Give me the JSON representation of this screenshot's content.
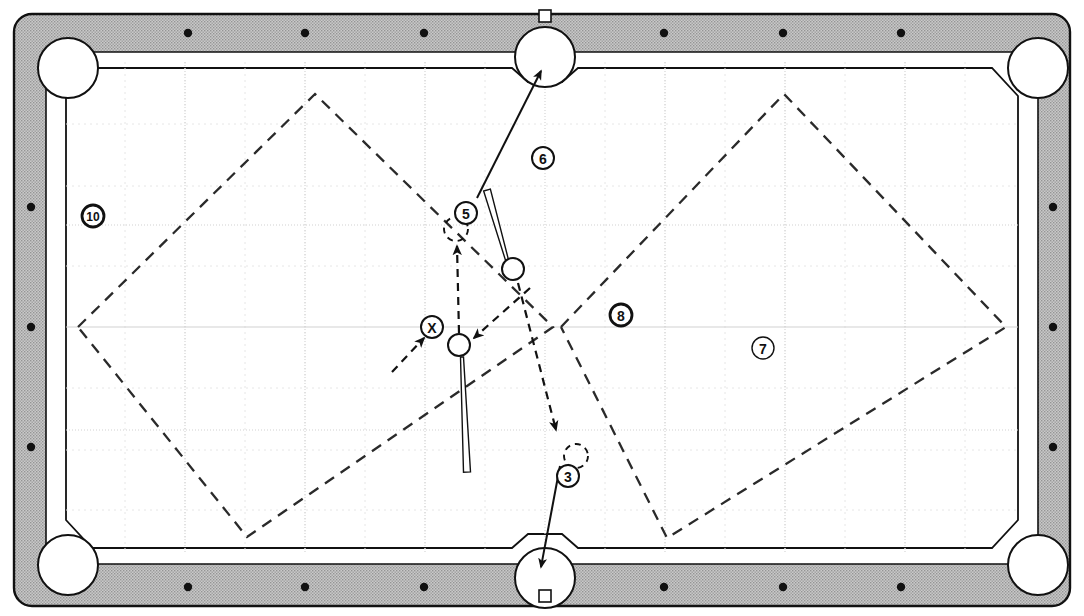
{
  "diagram": {
    "surface_color": "#ffffff",
    "rail_color": "#b3b3b3",
    "rail_edge_color": "#1a1a1a",
    "line_color": "#1a1a1a",
    "grid_color": "#cfcfcf",
    "grid_fine_color": "#e2e2e2"
  },
  "table": {
    "outer": {
      "x": 8,
      "y": 14,
      "width": 1068,
      "height": 592
    },
    "rail_width": 38,
    "playfield": {
      "x": 66,
      "y": 62,
      "width": 952,
      "height": 492
    },
    "sight_dot_color": "#111111",
    "sight_dots_top": [
      188,
      305,
      424,
      664,
      783,
      901
    ],
    "sight_dots_bottom": [
      188,
      305,
      424,
      664,
      783,
      901
    ],
    "sight_dots_left": [
      207,
      327,
      447
    ],
    "sight_dots_right": [
      207,
      327,
      447
    ]
  },
  "pockets": [
    {
      "name": "top-left-pocket",
      "cx": 68,
      "cy": 68,
      "r": 30
    },
    {
      "name": "top-center-pocket",
      "cx": 545,
      "cy": 57,
      "r": 30
    },
    {
      "name": "top-right-pocket",
      "cx": 1038,
      "cy": 68,
      "r": 30
    },
    {
      "name": "bottom-left-pocket",
      "cx": 68,
      "cy": 565,
      "r": 30
    },
    {
      "name": "bottom-center-pocket",
      "cx": 545,
      "cy": 578,
      "r": 30
    },
    {
      "name": "bottom-right-pocket",
      "cx": 1038,
      "cy": 565,
      "r": 30
    }
  ],
  "labels": [
    {
      "id": "label-10",
      "text": "10",
      "cx": 93,
      "cy": 216,
      "r": 11,
      "weight": "heavy"
    },
    {
      "id": "label-6",
      "text": "6",
      "cx": 543,
      "cy": 158,
      "r": 11,
      "weight": "medium"
    },
    {
      "id": "label-5",
      "text": "5",
      "cx": 466,
      "cy": 213,
      "r": 11,
      "weight": "medium"
    },
    {
      "id": "label-8",
      "text": "8",
      "cx": 621,
      "cy": 315,
      "r": 11,
      "weight": "heavy"
    },
    {
      "id": "label-7",
      "text": "7",
      "cx": 763,
      "cy": 348,
      "r": 11,
      "weight": "light"
    },
    {
      "id": "label-x",
      "text": "X",
      "cx": 432,
      "cy": 327,
      "r": 11,
      "weight": "medium"
    },
    {
      "id": "label-3",
      "text": "3",
      "cx": 568,
      "cy": 476,
      "r": 11,
      "weight": "medium"
    }
  ],
  "balls": [
    {
      "name": "cue-ball-lower",
      "cx": 459,
      "cy": 345,
      "r": 11
    },
    {
      "name": "object-ball-upper",
      "cx": 513,
      "cy": 269,
      "r": 11
    }
  ],
  "ghost_balls": [
    {
      "name": "ghost-ball-5",
      "cx": 456,
      "cy": 229,
      "r": 12
    },
    {
      "name": "ghost-ball-3",
      "cx": 576,
      "cy": 456,
      "r": 12
    }
  ],
  "cues": [
    {
      "name": "cue-stick-lower",
      "x1": 462,
      "y1": 357,
      "x2": 467,
      "y2": 472,
      "butt_width": 7,
      "tip_width": 3
    },
    {
      "name": "cue-stick-upper",
      "x1": 507,
      "y1": 260,
      "x2": 487,
      "y2": 190,
      "butt_width": 7,
      "tip_width": 3
    }
  ],
  "solid_shots": [
    {
      "name": "shot-to-top-pocket",
      "x1": 477,
      "y1": 198,
      "x2": 541,
      "y2": 71
    },
    {
      "name": "shot-to-bottom-pocket",
      "x1": 560,
      "y1": 466,
      "x2": 541,
      "y2": 567
    }
  ],
  "dashed_paths": [
    {
      "name": "cue-path-up",
      "points": "459,333 457,246",
      "arrow_at_end": true
    },
    {
      "name": "incoming-path-to-cue",
      "points": "530,288 474,338",
      "arrow_at_end": true
    },
    {
      "name": "outgoing-path-left",
      "points": "392,372 424,338",
      "arrow_at_end": true
    },
    {
      "name": "path-to-ghost-3",
      "points": "518,283 556,430",
      "arrow_at_end": true
    }
  ],
  "diamonds": [
    {
      "name": "left-diamond",
      "points": "78,327 315,94 553,327 247,537 78,327"
    },
    {
      "name": "right-diamond",
      "points": "561,327 784,94 1006,327 667,538 561,327"
    }
  ]
}
